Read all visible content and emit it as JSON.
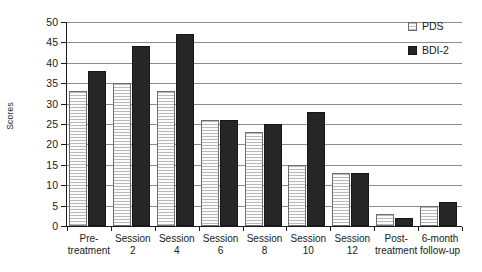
{
  "chart_data": {
    "type": "bar",
    "title": "",
    "xlabel": "",
    "ylabel": "Scores",
    "ylim": [
      0,
      50
    ],
    "ytick_step": 5,
    "yticks": [
      50,
      45,
      40,
      35,
      30,
      25,
      20,
      15,
      10,
      5,
      0
    ],
    "grid": true,
    "grid_axis": "y",
    "legend_position": "top-right",
    "categories": [
      "Pre-\ntreatment",
      "Session\n2",
      "Session\n4",
      "Session\n6",
      "Session\n8",
      "Session\n10",
      "Session\n12",
      "Post-\ntreatment",
      "6-month\nfollow-up"
    ],
    "series": [
      {
        "name": "PDS",
        "color": "#f2f2f2",
        "pattern": "horizontal-hatch",
        "values": [
          33,
          35,
          33,
          26,
          23,
          15,
          13,
          3,
          5
        ]
      },
      {
        "name": "BDI-2",
        "color": "#262626",
        "pattern": "solid",
        "values": [
          38,
          44,
          47,
          26,
          25,
          28,
          13,
          2,
          6
        ]
      }
    ]
  },
  "legend": {
    "items": [
      {
        "label": "PDS",
        "swatch": "pds"
      },
      {
        "label": "BDI-2",
        "swatch": "bdi"
      }
    ]
  }
}
